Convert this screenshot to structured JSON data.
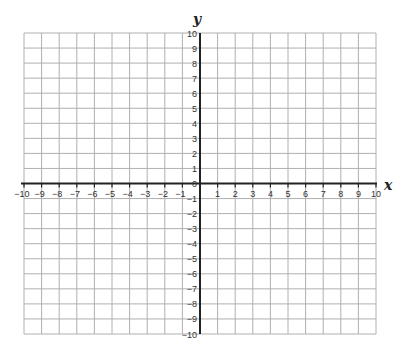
{
  "chart_data": {
    "type": "coordinate-grid",
    "title": "",
    "xlabel": "x",
    "ylabel": "y",
    "xlim": [
      -10,
      10
    ],
    "ylim": [
      -10,
      10
    ],
    "grid": true,
    "grid_step": 1,
    "x_ticks": [
      -10,
      -9,
      -8,
      -7,
      -6,
      -5,
      -4,
      -3,
      -2,
      -1,
      1,
      2,
      3,
      4,
      5,
      6,
      7,
      8,
      9,
      10
    ],
    "y_ticks": [
      10,
      9,
      8,
      7,
      6,
      5,
      4,
      3,
      2,
      1,
      0,
      -1,
      -2,
      -3,
      -4,
      -5,
      -6,
      -7,
      -8,
      -9,
      -10
    ],
    "series": []
  },
  "labels": {
    "x_axis": "x",
    "y_axis": "y"
  },
  "colors": {
    "grid": "#b0b0b0",
    "axis": "#222222",
    "text": "#333333"
  }
}
